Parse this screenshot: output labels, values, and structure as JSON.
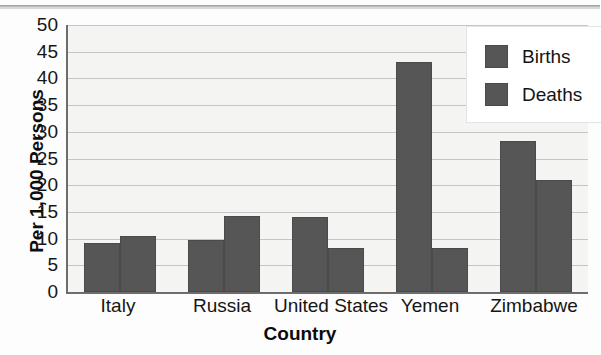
{
  "chart": {
    "title": "",
    "xtitle": "Country",
    "ytitle": "Per 1,000 Persons"
  },
  "legend": {
    "items": [
      {
        "label": "Births",
        "color": "#565656"
      },
      {
        "label": "Deaths",
        "color": "#565656"
      }
    ]
  },
  "yticks": [
    "0",
    "5",
    "10",
    "15",
    "20",
    "25",
    "30",
    "35",
    "40",
    "45",
    "50"
  ],
  "chart_data": {
    "type": "bar",
    "title": "",
    "xlabel": "Country",
    "ylabel": "Per 1,000 Persons",
    "categories": [
      "Italy",
      "Russia",
      "United States",
      "Yemen",
      "Zimbabwe"
    ],
    "series": [
      {
        "name": "Births",
        "values": [
          9.2,
          9.8,
          14.0,
          43.0,
          28.3
        ]
      },
      {
        "name": "Deaths",
        "values": [
          10.4,
          14.3,
          8.2,
          8.3,
          21.0
        ]
      }
    ],
    "ylim": [
      0,
      50
    ],
    "ytick_step": 5,
    "grid": true,
    "legend_position": "top-right",
    "bar_color": "#565656",
    "plot_background": "#f4f4f2",
    "gridline_color": "#c6c6c6"
  }
}
